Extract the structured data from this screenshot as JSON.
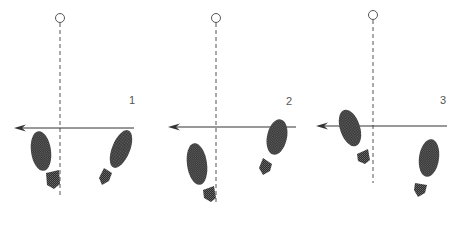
{
  "diagram": {
    "type": "footprint-sequence",
    "colors": {
      "line": "#333333",
      "dashed": "#555555",
      "footprint": "#3a3a3a",
      "circle": "#555555",
      "label": "#555555"
    },
    "panels": [
      {
        "label": "1",
        "label_pos": [
          132,
          104
        ],
        "axis_x": 60,
        "circle_y": 18,
        "dash_y2": 197,
        "line_y": 128,
        "line_x1": 14,
        "line_x2": 134,
        "left_foot": {
          "cx": 41,
          "cy": 151,
          "rx": 10,
          "ry": 20,
          "rot": -8,
          "heel": "M46,173 L59,170 L60,184 L54,189 L47,185 Z"
        },
        "right_foot": {
          "cx": 121,
          "cy": 149,
          "rx": 9,
          "ry": 20,
          "rot": 22,
          "heel": "M104,168 L112,173 L109,181 L102,185 L99,178 Z"
        }
      },
      {
        "label": "2",
        "label_pos": [
          289,
          105
        ],
        "axis_x": 216,
        "circle_y": 18,
        "dash_y2": 205,
        "line_y": 127,
        "line_x1": 168,
        "line_x2": 296,
        "left_foot": {
          "cx": 197,
          "cy": 164,
          "rx": 10,
          "ry": 21,
          "rot": -8,
          "heel": "M203,190 L214,186 L216,198 L211,202 L204,198 Z"
        },
        "right_foot": {
          "cx": 277,
          "cy": 137,
          "rx": 10,
          "ry": 18,
          "rot": 12,
          "heel": "M263,158 L272,164 L270,171 L263,175 L259,168 Z"
        }
      },
      {
        "label": "3",
        "label_pos": [
          443,
          104
        ],
        "axis_x": 373,
        "circle_y": 15,
        "dash_y2": 183,
        "line_y": 126,
        "line_x1": 316,
        "line_x2": 447,
        "left_foot": {
          "cx": 350,
          "cy": 128,
          "rx": 10,
          "ry": 19,
          "rot": -18,
          "heel": "M357,154 L368,149 L370,160 L365,164 L358,161 Z"
        },
        "right_foot": {
          "cx": 429,
          "cy": 158,
          "rx": 10,
          "ry": 19,
          "rot": 8,
          "heel": "M415,183 L427,185 L425,193 L418,197 L414,190 Z"
        }
      }
    ]
  }
}
